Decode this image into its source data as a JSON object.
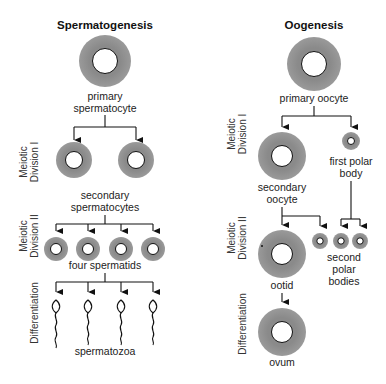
{
  "spermatogenesis": {
    "title": "Spermatogenesis",
    "primary_label_1": "primary",
    "primary_label_2": "spermatocyte",
    "secondary_label_1": "secondary",
    "secondary_label_2": "spermatocytes",
    "spermatids_label": "four spermatids",
    "spermatozoa_label": "spermatozoa",
    "stages": {
      "meiotic_1_line1": "Meiotic",
      "meiotic_1_line2": "Division I",
      "meiotic_2_line1": "Meiotic",
      "meiotic_2_line2": "Division II",
      "differentiation": "Differentiation"
    }
  },
  "oogenesis": {
    "title": "Oogenesis",
    "primary_label": "primary oocyte",
    "first_polar_label_1": "first polar",
    "first_polar_label_2": "body",
    "secondary_label_1": "secondary",
    "secondary_label_2": "oocyte",
    "second_polar_label_1": "second",
    "second_polar_label_2": "polar",
    "second_polar_label_3": "bodies",
    "ootid_label": "ootid",
    "ovum_label": "ovum",
    "stages": {
      "meiotic_1_line1": "Meiotic",
      "meiotic_1_line2": "Division I",
      "meiotic_2_line1": "Meiotic",
      "meiotic_2_line2": "Division II",
      "differentiation": "Differentiation"
    }
  },
  "colors": {
    "cytoplasm": "#8f8f8f",
    "nucleus": "#ffffff",
    "line": "#111111"
  }
}
